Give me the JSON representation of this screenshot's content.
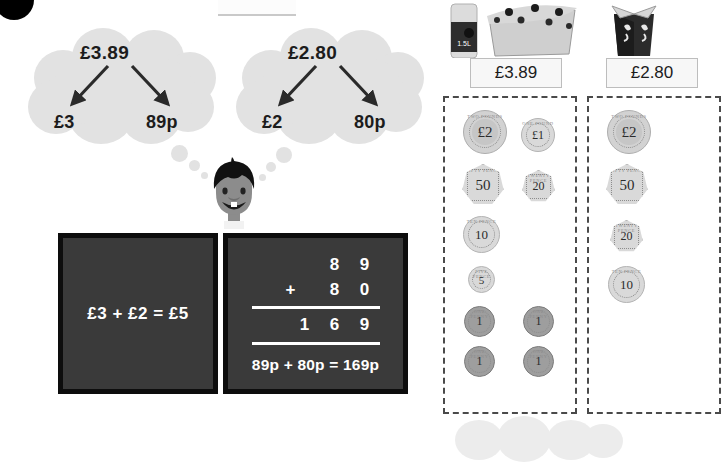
{
  "page": {
    "badge": "question-number-badge"
  },
  "clouds": [
    {
      "name": "partition-cloud-1",
      "total": "£3.89",
      "pounds": "£3",
      "pence": "89p"
    },
    {
      "name": "partition-cloud-2",
      "total": "£2.80",
      "pounds": "£2",
      "pence": "80p"
    }
  ],
  "character": {
    "name": "thinking-boy",
    "hair_color": "#111111",
    "skin_color": "#8c8c8c"
  },
  "panels": {
    "pounds_panel": {
      "equation": "£3 + £2 = £5"
    },
    "pence_panel": {
      "rows": [
        {
          "op": "",
          "digits": [
            "8",
            "9"
          ]
        },
        {
          "op": "+",
          "digits": [
            "8",
            "0"
          ]
        }
      ],
      "answer_digits": [
        "1",
        "6",
        "9"
      ],
      "sentence": "89p + 80p = 169p"
    }
  },
  "products": [
    {
      "name": "drink-and-snack",
      "price": "£3.89",
      "bottle_label": "1.5L",
      "coins": [
        {
          "value": "£2",
          "type": "bimetal",
          "shape": "round",
          "legend": "TWO POUNDS",
          "size": 44
        },
        {
          "value": "£1",
          "type": "silver",
          "shape": "round",
          "legend": "ONE POUND",
          "size": 34
        },
        {
          "value": "50",
          "type": "silver",
          "shape": "hepta",
          "legend": "FIFTY PENCE",
          "size": 40
        },
        {
          "value": "20",
          "type": "silver",
          "shape": "hepta",
          "legend": "TWENTY PENCE",
          "size": 32
        },
        {
          "value": "10",
          "type": "silver",
          "shape": "round",
          "legend": "TEN PENCE",
          "size": 36
        },
        {
          "value": "5",
          "type": "silver",
          "shape": "round",
          "legend": "FIVE PENCE",
          "size": 26
        },
        {
          "value": "1",
          "type": "copper",
          "shape": "round",
          "legend": "ONE PENNY",
          "size": 30
        },
        {
          "value": "1",
          "type": "copper",
          "shape": "round",
          "legend": "ONE PENNY",
          "size": 30
        },
        {
          "value": "1",
          "type": "copper",
          "shape": "round",
          "legend": "ONE PENNY",
          "size": 30
        },
        {
          "value": "1",
          "type": "copper",
          "shape": "round",
          "legend": "ONE PENNY",
          "size": 30
        }
      ]
    },
    {
      "name": "takeaway-box",
      "price": "£2.80",
      "coins": [
        {
          "value": "£2",
          "type": "bimetal",
          "shape": "round",
          "legend": "TWO POUNDS",
          "size": 44
        },
        {
          "value": "50",
          "type": "silver",
          "shape": "hepta",
          "legend": "FIFTY PENCE",
          "size": 40
        },
        {
          "value": "20",
          "type": "silver",
          "shape": "hepta",
          "legend": "TWENTY PENCE",
          "size": 32
        },
        {
          "value": "10",
          "type": "silver",
          "shape": "round",
          "legend": "TEN PENCE",
          "size": 36
        }
      ]
    }
  ],
  "colors": {
    "cloud": "#e2e2e2",
    "panel_bg": "#3a3a3a",
    "panel_border": "#0d0d0d",
    "panel_text": "#ffffff",
    "arrow": "#2a2a2a",
    "dash_border": "#4a4a4a"
  }
}
